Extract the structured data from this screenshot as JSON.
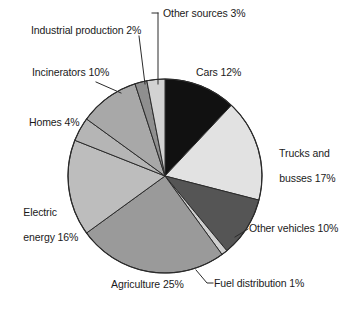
{
  "figure": {
    "kind": "pie-chart",
    "background_color": "#ffffff",
    "text_color": "#1a1a1a",
    "outline_color": "#2b2b2b"
  },
  "chart_data": {
    "type": "pie",
    "title": "",
    "subtitle": "",
    "xlabel": "",
    "ylabel": "",
    "grid": false,
    "legend_position": "none",
    "label_style": "external-with-leader-lines",
    "units": "percent",
    "total": 100,
    "start_angle_deg": 0,
    "direction": "clockwise",
    "categories": [
      "Cars",
      "Trucks and busses",
      "Other vehicles",
      "Fuel distribution",
      "Agriculture",
      "Electric energy",
      "Homes",
      "Incinerators",
      "Industrial production",
      "Other sources"
    ],
    "values": [
      12,
      17,
      10,
      1,
      25,
      16,
      4,
      10,
      2,
      3
    ],
    "slice_colors": [
      "#111111",
      "#e2e2e2",
      "#555555",
      "#cfcfcf",
      "#9a9a9a",
      "#bdbdbd",
      "#b5b5b5",
      "#a8a8a8",
      "#8f8f8f",
      "#d2d2d2"
    ],
    "slices": [
      {
        "label": "Cars 12%",
        "name": "Cars",
        "value": 12,
        "color": "#111111"
      },
      {
        "label": "Trucks and busses 17%",
        "name": "Trucks and busses",
        "value": 17,
        "color": "#e2e2e2"
      },
      {
        "label": "Other vehicles 10%",
        "name": "Other vehicles",
        "value": 10,
        "color": "#555555"
      },
      {
        "label": "Fuel distribution 1%",
        "name": "Fuel distribution",
        "value": 1,
        "color": "#cfcfcf"
      },
      {
        "label": "Agriculture 25%",
        "name": "Agriculture",
        "value": 25,
        "color": "#9a9a9a"
      },
      {
        "label": "Electric energy 16%",
        "name": "Electric energy",
        "value": 16,
        "color": "#bdbdbd"
      },
      {
        "label": "Homes 4%",
        "name": "Homes",
        "value": 4,
        "color": "#b5b5b5"
      },
      {
        "label": "Incinerators 10%",
        "name": "Incinerators",
        "value": 10,
        "color": "#a8a8a8"
      },
      {
        "label": "Industrial production 2%",
        "name": "Industrial production",
        "value": 2,
        "color": "#8f8f8f"
      },
      {
        "label": "Other sources 3%",
        "name": "Other sources",
        "value": 3,
        "color": "#d2d2d2"
      }
    ]
  },
  "labels": {
    "other_sources": "Other sources 3%",
    "industrial_production": "Industrial production 2%",
    "incinerators": "Incinerators 10%",
    "homes": "Homes 4%",
    "electric_energy_line1": "Electric",
    "electric_energy_line2": "energy 16%",
    "agriculture": "Agriculture 25%",
    "fuel_distribution": "Fuel distribution 1%",
    "other_vehicles": "Other vehicles 10%",
    "trucks_line1": "Trucks and",
    "trucks_line2": "busses 17%",
    "cars": "Cars 12%"
  }
}
